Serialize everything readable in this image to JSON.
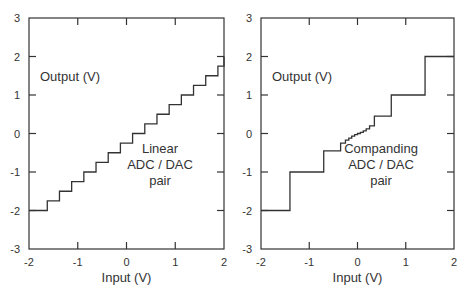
{
  "chart_data": [
    {
      "type": "line",
      "step": true,
      "title": "",
      "xlabel": "Input (V)",
      "ylabel": "Output (V)",
      "xlim": [
        -2,
        2
      ],
      "ylim": [
        -3,
        3
      ],
      "xticks": [
        "-2",
        "-1",
        "0",
        "1",
        "2"
      ],
      "yticks": [
        "3",
        "2",
        "1",
        "0",
        "-1",
        "-2",
        "-3"
      ],
      "grid": false,
      "annotation": [
        "Linear",
        "ADC / DAC",
        "pair"
      ],
      "series": [
        {
          "name": "Linear ADC/DAC transfer",
          "x": [
            -1.875,
            -1.625,
            -1.375,
            -1.125,
            -0.875,
            -0.625,
            -0.375,
            -0.125,
            0.125,
            0.375,
            0.625,
            0.875,
            1.125,
            1.375,
            1.625,
            1.875,
            2.0
          ],
          "y": [
            -2.0,
            -1.75,
            -1.5,
            -1.25,
            -1.0,
            -0.75,
            -0.5,
            -0.25,
            0.0,
            0.25,
            0.5,
            0.75,
            1.0,
            1.25,
            1.5,
            1.75,
            2.0
          ]
        }
      ]
    },
    {
      "type": "line",
      "step": true,
      "title": "",
      "xlabel": "Input (V)",
      "ylabel": "Output (V)",
      "xlim": [
        -2,
        2
      ],
      "ylim": [
        -3,
        3
      ],
      "xticks": [
        "-2",
        "-1",
        "0",
        "1",
        "2"
      ],
      "yticks": [
        "3",
        "2",
        "1",
        "0",
        "-1",
        "-2",
        "-3"
      ],
      "grid": false,
      "annotation": [
        "Companding",
        "ADC / DAC",
        "pair"
      ],
      "series": [
        {
          "name": "Companding ADC/DAC transfer",
          "x": [
            -2.0,
            -1.4,
            -0.7,
            -0.35,
            -0.25,
            -0.18,
            -0.12,
            -0.06,
            0.0,
            0.06,
            0.12,
            0.18,
            0.25,
            0.35,
            0.7,
            1.4,
            2.0
          ],
          "y": [
            -2.0,
            -1.0,
            -0.45,
            -0.25,
            -0.17,
            -0.12,
            -0.07,
            -0.03,
            0.0,
            0.03,
            0.07,
            0.12,
            0.2,
            0.45,
            1.0,
            2.0,
            2.0
          ]
        }
      ]
    }
  ],
  "panels": [
    {
      "ylabel": "Output (V)",
      "xlabel": "Input (V)",
      "annotation": [
        "Linear",
        "ADC / DAC",
        "pair"
      ]
    },
    {
      "ylabel": "Output (V)",
      "xlabel": "Input (V)",
      "annotation": [
        "Companding",
        "ADC / DAC",
        "pair"
      ]
    }
  ]
}
